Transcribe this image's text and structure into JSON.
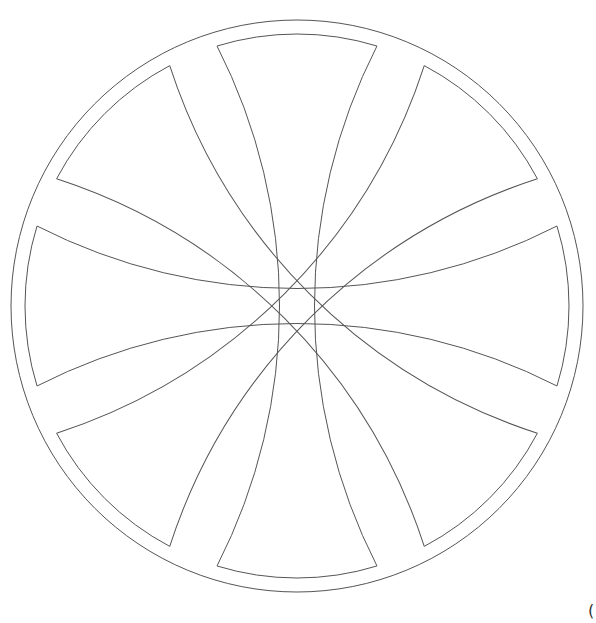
{
  "figure": {
    "stroke_color": "#555555",
    "background": "#ffffff",
    "center": [
      297,
      306
    ],
    "outer_radius": 286,
    "inner_radius": 272,
    "band_arc_radius": 572,
    "band_half_angle_deg": 17.1,
    "band_rotations_deg": [
      0,
      45,
      90,
      135
    ],
    "wedge_count": 8
  },
  "corner_glyph": "("
}
